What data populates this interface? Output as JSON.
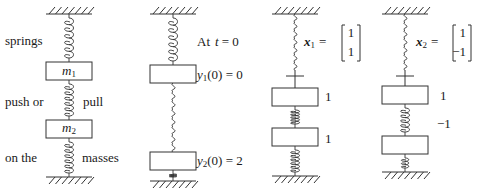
{
  "figure": {
    "panels": [
      {
        "id": "setup",
        "labels_left": [
          "springs",
          "push or",
          "on the"
        ],
        "labels_right": [
          "pull",
          "masses"
        ],
        "mass_labels": [
          "m",
          "m"
        ],
        "mass_subscripts": [
          "1",
          "2"
        ]
      },
      {
        "id": "initial",
        "heading": "At",
        "heading_var": "t",
        "heading_eq": "= 0",
        "y1_var": "y",
        "y1_sub": "1",
        "y1_rest": "(0) = 0",
        "y2_var": "y",
        "y2_sub": "2",
        "y2_rest": "(0) = 2"
      },
      {
        "id": "mode1",
        "vector_name": "x",
        "vector_sub": "1",
        "equals": "=",
        "vector": [
          "1",
          "1"
        ],
        "mass_values": [
          "1",
          "1"
        ]
      },
      {
        "id": "mode2",
        "vector_name": "x",
        "vector_sub": "2",
        "equals": "=",
        "vector": [
          "1",
          "−1"
        ],
        "mass_values": [
          "1",
          "−1"
        ]
      }
    ]
  }
}
